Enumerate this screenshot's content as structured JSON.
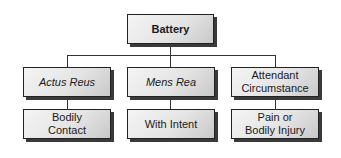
{
  "root": {
    "label": "Battery"
  },
  "elements": [
    {
      "label": "Actus Reus",
      "style": "italic",
      "child": "Bodily\nContact"
    },
    {
      "label": "Mens Rea",
      "style": "italic",
      "child": "With Intent"
    },
    {
      "label": "Attendant\nCircumstance",
      "style": "normal",
      "child": "Pain or\nBodily Injury"
    }
  ]
}
